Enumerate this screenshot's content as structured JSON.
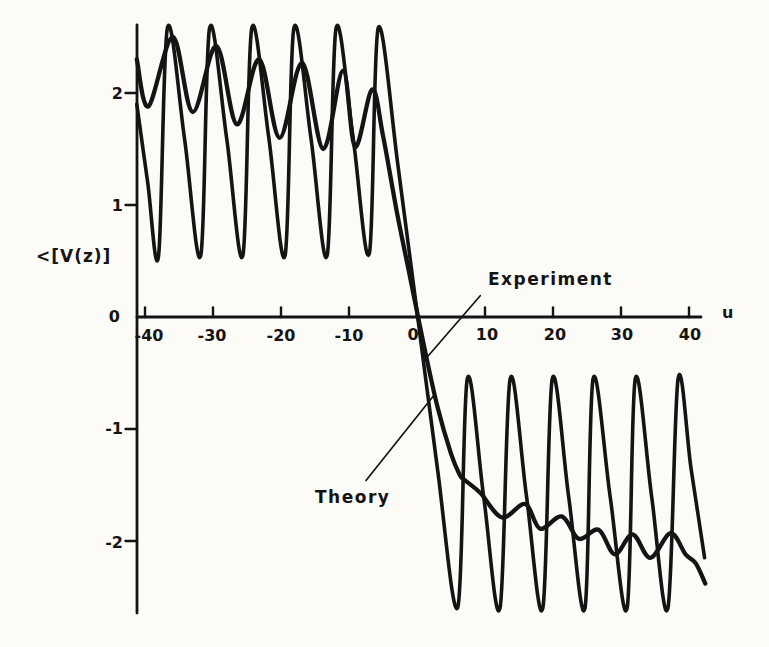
{
  "figure": {
    "background": "#fcfbf8",
    "ink": "#161412"
  },
  "chart_data": {
    "type": "line",
    "title": "",
    "xlabel": "u",
    "ylabel": "<[V(z)]",
    "x_ticks": [
      -40,
      -30,
      -20,
      -10,
      0,
      10,
      20,
      30,
      40
    ],
    "x_tick_labels": [
      "-40",
      "-30",
      "-20",
      "-10",
      "0",
      "10",
      "20",
      "30",
      "40"
    ],
    "y_ticks": [
      2,
      1,
      0,
      -1,
      -2
    ],
    "y_tick_labels": [
      "2",
      "1",
      "0",
      "-1",
      "-2"
    ],
    "xlim": [
      -41.2,
      42.5
    ],
    "ylim": [
      -2.8,
      2.7
    ],
    "grid": false,
    "legend_position": "inline-annotations",
    "series": [
      {
        "name": "Theory",
        "points": [
          [
            -41.2,
            1.9
          ],
          [
            -39.6,
            1.2
          ],
          [
            -38,
            0.55
          ],
          [
            -36.7,
            2.58
          ],
          [
            -34.2,
            1.6
          ],
          [
            -31.8,
            0.55
          ],
          [
            -30.5,
            2.58
          ],
          [
            -28,
            1.6
          ],
          [
            -25.6,
            0.55
          ],
          [
            -24.3,
            2.58
          ],
          [
            -21.8,
            1.6
          ],
          [
            -19.4,
            0.55
          ],
          [
            -18.1,
            2.58
          ],
          [
            -15.6,
            1.6
          ],
          [
            -13.2,
            0.55
          ],
          [
            -11.9,
            2.58
          ],
          [
            -9.4,
            1.6
          ],
          [
            -7,
            0.57
          ],
          [
            -5.7,
            2.58
          ],
          [
            -2.8,
            1.35
          ],
          [
            0.1,
            0
          ],
          [
            3,
            -1.35
          ],
          [
            6,
            -2.59
          ],
          [
            7.4,
            -0.55
          ],
          [
            9.8,
            -1.6
          ],
          [
            12.2,
            -2.6
          ],
          [
            13.7,
            -0.55
          ],
          [
            16.1,
            -1.6
          ],
          [
            18.5,
            -2.6
          ],
          [
            19.9,
            -0.55
          ],
          [
            22.3,
            -1.6
          ],
          [
            24.7,
            -2.6
          ],
          [
            25.9,
            -0.55
          ],
          [
            28.4,
            -1.6
          ],
          [
            30.9,
            -2.6
          ],
          [
            32.1,
            -0.55
          ],
          [
            34.5,
            -1.6
          ],
          [
            36.9,
            -2.6
          ],
          [
            38.4,
            -0.55
          ],
          [
            40.3,
            -1.35
          ],
          [
            42.3,
            -2.15
          ]
        ]
      },
      {
        "name": "Experiment",
        "points": [
          [
            -41.2,
            2.3
          ],
          [
            -39.5,
            1.88
          ],
          [
            -35.9,
            2.5
          ],
          [
            -33,
            1.83
          ],
          [
            -29.5,
            2.42
          ],
          [
            -26.5,
            1.72
          ],
          [
            -23.2,
            2.3
          ],
          [
            -20.2,
            1.6
          ],
          [
            -16.9,
            2.27
          ],
          [
            -13.8,
            1.5
          ],
          [
            -10.9,
            2.2
          ],
          [
            -9.1,
            1.52
          ],
          [
            -6.6,
            2.03
          ],
          [
            -5,
            1.62
          ],
          [
            -3,
            0.95
          ],
          [
            -1,
            0.35
          ],
          [
            1,
            -0.25
          ],
          [
            3,
            -0.8
          ],
          [
            5,
            -1.22
          ],
          [
            6.3,
            -1.41
          ],
          [
            7.1,
            -1.46
          ],
          [
            9.3,
            -1.57
          ],
          [
            12.5,
            -1.79
          ],
          [
            15.9,
            -1.67
          ],
          [
            18.1,
            -1.89
          ],
          [
            21.3,
            -1.78
          ],
          [
            23.8,
            -1.98
          ],
          [
            26.7,
            -1.9
          ],
          [
            29.1,
            -2.12
          ],
          [
            31.7,
            -1.94
          ],
          [
            34.3,
            -2.15
          ],
          [
            37.3,
            -1.93
          ],
          [
            39.5,
            -2.12
          ],
          [
            41,
            -2.2
          ],
          [
            42.4,
            -2.38
          ]
        ]
      }
    ],
    "annotations": [
      {
        "text": "Experiment",
        "leader": [
          [
            9.3,
            0.19
          ],
          [
            1.6,
            -0.35
          ]
        ]
      },
      {
        "text": "Theory",
        "leader": [
          [
            -7.5,
            -1.46
          ],
          [
            2.35,
            -0.71
          ]
        ]
      }
    ]
  }
}
